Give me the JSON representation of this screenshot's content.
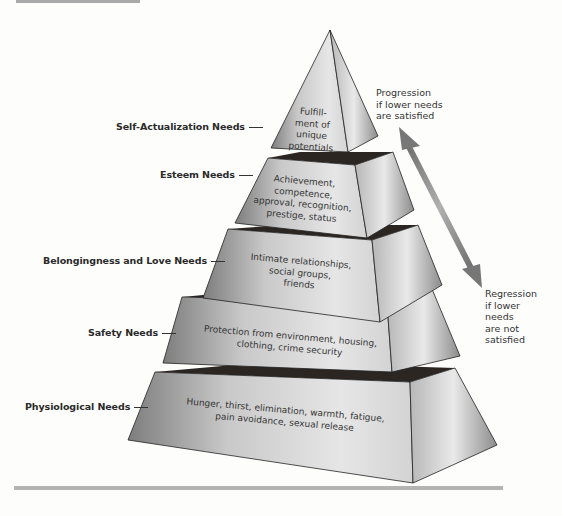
{
  "diagram": {
    "type": "pyramid",
    "title_hint": "Maslow's hierarchy of needs",
    "levels": [
      {
        "label": "Self-Actualization Needs",
        "description_lines": [
          "Fulfill-",
          "ment of",
          "unique",
          "potentials"
        ]
      },
      {
        "label": "Esteem Needs",
        "description_lines": [
          "Achievement,",
          "competence,",
          "approval, recognition,",
          "prestige, status"
        ]
      },
      {
        "label": "Belongingness and Love Needs",
        "description_lines": [
          "Intimate relationships,",
          "social groups,",
          "friends"
        ]
      },
      {
        "label": "Safety Needs",
        "description_lines": [
          "Protection from environment, housing,",
          "clothing, crime security"
        ]
      },
      {
        "label": "Physiological Needs",
        "description_lines": [
          "Hunger, thirst, elimination, warmth, fatigue,",
          "pain avoidance, sexual release"
        ]
      }
    ],
    "progression": {
      "lines": [
        "Progression",
        "if lower needs",
        "are satisfied"
      ]
    },
    "regression": {
      "lines": [
        "Regression",
        "if lower",
        "needs",
        "are not",
        "satisfied"
      ]
    },
    "colors": {
      "face_light": "#dcdcdc",
      "face_dark": "#8f8f8f",
      "gap": "#2b2622",
      "arrow": "#8a8a8a"
    }
  }
}
